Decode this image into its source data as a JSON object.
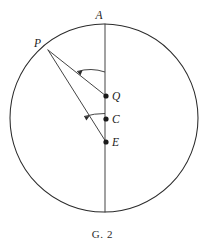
{
  "figure": {
    "caption": "G. 2",
    "stroke_color": "#2b2b2b",
    "background_color": "#ffffff",
    "labels": {
      "apex": "A",
      "external": "P",
      "q_point": "Q",
      "center": "C",
      "e_point": "E"
    },
    "geometry": {
      "circle": {
        "cx": 104,
        "cy": 118,
        "r": 94
      },
      "diameter_line": {
        "x1": 105,
        "y1": 24,
        "x2": 105,
        "y2": 212
      },
      "points": {
        "A": {
          "x": 105,
          "y": 24
        },
        "P": {
          "x": 48,
          "y": 50
        },
        "Q": {
          "x": 106,
          "y": 96
        },
        "C": {
          "x": 106,
          "y": 119
        },
        "E": {
          "x": 106,
          "y": 142
        }
      },
      "rays": [
        {
          "name": "PQ",
          "x1": 48,
          "y1": 50,
          "x2": 106,
          "y2": 96
        },
        {
          "name": "PE",
          "x1": 48,
          "y1": 50,
          "x2": 106,
          "y2": 142
        }
      ],
      "angle_arcs": [
        {
          "name": "angle-QPA",
          "vertex": "P",
          "radius": 46,
          "label": ""
        },
        {
          "name": "angle-EPC",
          "vertex": "P",
          "radius": 72,
          "label": ""
        }
      ]
    }
  }
}
